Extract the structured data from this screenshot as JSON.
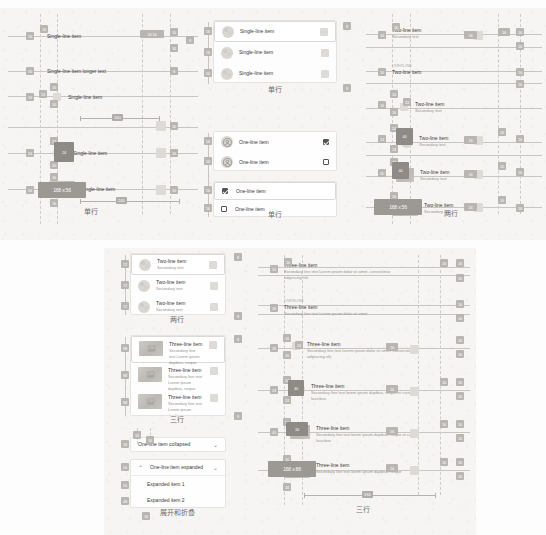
{
  "meta": {
    "doc_kind": "redline-spec-sheet",
    "accent": "#b9b6b2",
    "panel_bg": "#f6f5f3",
    "card_bg": "#fefefe"
  },
  "captions": {
    "single_line": "单行",
    "single_line_2": "单行",
    "two_line": "两行",
    "two_line_2": "两行",
    "three_line": "三行",
    "three_line_2": "三行",
    "expand_collapse": "展开和折叠"
  },
  "panel_top": {
    "col_left": {
      "title": "单行",
      "rows": [
        {
          "label": "Single-line item",
          "variant": "spec-plain"
        },
        {
          "label": "Single-line item longer text",
          "variant": "spec-plain"
        },
        {
          "label": "Single-line item",
          "variant": "spec-icon"
        },
        {
          "label": "Single-line item",
          "variant": "spec-avatar"
        },
        {
          "label": "Single-line item",
          "variant": "spec-thumb"
        }
      ],
      "badges": [
        "16",
        "16",
        "16",
        "16",
        "16",
        "16",
        "24",
        "24",
        "24",
        "40",
        "56"
      ],
      "size_badges": [
        "168 x 56"
      ],
      "dim_labels": [
        "160",
        "240"
      ]
    },
    "col_mid_top": {
      "title": "单行",
      "rows": [
        {
          "label": "Single-line item",
          "avatar": "texture",
          "trailing": "square",
          "selected": true
        },
        {
          "label": "Single-line item",
          "avatar": "texture",
          "trailing": "square",
          "selected": false
        },
        {
          "label": "Single-line item",
          "avatar": "texture",
          "trailing": "square",
          "selected": false
        }
      ],
      "badges": [
        "56",
        "56",
        "56",
        "8",
        "8"
      ]
    },
    "col_mid_bottom": {
      "rows": [
        {
          "label": "One-line item",
          "avatar": "person",
          "trailing": "checkbox-checked",
          "card": "a"
        },
        {
          "label": "One-line item",
          "avatar": "person",
          "trailing": "checkbox",
          "card": "a"
        },
        {
          "label": "One-line item",
          "leading": "checkbox-checked",
          "card": "b"
        },
        {
          "label": "One-line item",
          "leading": "checkbox",
          "card": "b"
        }
      ],
      "badges": [
        "56",
        "56",
        "56",
        "56"
      ]
    },
    "col_right": {
      "title": "两行",
      "rows": [
        {
          "title": "Two-line item",
          "secondary": "Secondary text",
          "variant": "plain"
        },
        {
          "overline": "OVERLINE",
          "title": "Two-line item",
          "variant": "overline"
        },
        {
          "title": "Two-line item",
          "secondary": "Secondary text",
          "variant": "icon"
        },
        {
          "title": "Two-line item",
          "secondary": "Secondary text",
          "variant": "avatar"
        },
        {
          "title": "Two-line item",
          "secondary": "Secondary text",
          "variant": "avatar2"
        },
        {
          "title": "Two-line item",
          "secondary": "Secondary text",
          "variant": "thumb"
        }
      ],
      "badges": [
        "16",
        "16",
        "16",
        "16",
        "16",
        "16",
        "24",
        "24",
        "24",
        "24",
        "40",
        "72"
      ],
      "size_badges": [
        "168 x 56"
      ]
    }
  },
  "panel_bottom": {
    "col_left_top": {
      "title": "两行",
      "rows": [
        {
          "title": "Two-line item",
          "secondary": "Secondary text",
          "selected": true
        },
        {
          "title": "Two-line item",
          "secondary": "Secondary text",
          "selected": false
        },
        {
          "title": "Two-line item",
          "secondary": "Secondary text",
          "selected": false
        }
      ],
      "badges": [
        "72",
        "72",
        "72",
        "8",
        "8"
      ]
    },
    "col_left_mid": {
      "title": "三行",
      "rows": [
        {
          "title": "Three-line item",
          "secondary": "Secondary line text Lorem ipsum dapibus, neque",
          "selected": true
        },
        {
          "title": "Three-line item",
          "secondary": "Secondary line text Lorem ipsum dapibus, neque",
          "selected": false
        },
        {
          "title": "Three-line item",
          "secondary": "Secondary line text Lorem ipsum dapibus, neque",
          "selected": false
        }
      ],
      "badges": [
        "88",
        "88",
        "88",
        "8",
        "8"
      ]
    },
    "col_left_bottom": {
      "title": "展开和折叠",
      "collapsed": {
        "label": "One-line item collapsed",
        "chevron": "chevron-down"
      },
      "expanded": {
        "label": "One-line item expanded",
        "chevron": "chevron-down",
        "lead": "chevron-up"
      },
      "children": [
        "Expanded item 1",
        "Expanded item 2"
      ],
      "badges": [
        "16",
        "16",
        "16",
        "56",
        "56",
        "48",
        "48",
        "16"
      ]
    },
    "col_right": {
      "title": "三行",
      "rows": [
        {
          "title": "Three-line item",
          "secondary": "Secondary line text Lorem ipsum dolor sit amet, consectetur adipiscing elit.",
          "variant": "plain"
        },
        {
          "overline": "OVERLINE",
          "title": "Three-line item",
          "secondary": "Secondary line text Lorem ipsum dolor sit amet",
          "variant": "overline"
        },
        {
          "title": "Three-line item",
          "secondary": "Secondary line text Lorem ipsum dolor sit amet, consectetur adipiscing elit",
          "variant": "icon"
        },
        {
          "title": "Three-line item",
          "secondary": "Secondary line text lorem ipsum dapibus, neque et cursus faucibus",
          "variant": "avatar"
        },
        {
          "title": "Three-line item",
          "secondary": "Secondary line text lorem ipsum dapibus, neque et cursus faucibus",
          "variant": "avatar2"
        },
        {
          "title": "Three-line item",
          "secondary": "Secondary line text lorem ipsum dapibus, neque",
          "variant": "thumb"
        }
      ],
      "badges": [
        "16",
        "16",
        "16",
        "16",
        "16",
        "16",
        "24",
        "24",
        "24",
        "24",
        "40",
        "88"
      ],
      "size_badges": [
        "168 x 88"
      ],
      "dim_labels": [
        "336"
      ]
    }
  }
}
